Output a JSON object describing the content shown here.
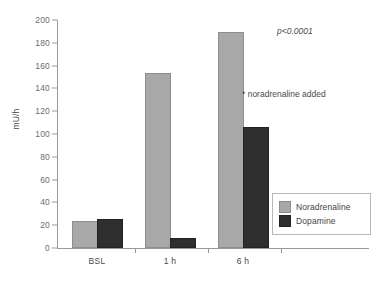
{
  "chart_data": {
    "type": "bar",
    "title": "",
    "xlabel": "",
    "ylabel": "mU/h",
    "categories": [
      "BSL",
      "1 h",
      "6 h"
    ],
    "ylim": [
      0,
      200
    ],
    "yticks": [
      0,
      20,
      40,
      60,
      80,
      100,
      120,
      140,
      160,
      180,
      200
    ],
    "grid": false,
    "legend_position": "bottom-right",
    "series": [
      {
        "name": "Noradrenaline",
        "color": "#a8a8a8",
        "values": [
          22,
          152,
          188
        ]
      },
      {
        "name": "Dopamine",
        "color": "#2e2e2e",
        "values": [
          24,
          7,
          104
        ]
      }
    ],
    "annotations": [
      {
        "id": "p-value",
        "text": "p<0.0001",
        "italic": true
      },
      {
        "id": "noradrenaline-added",
        "text": "* noradrenaline added",
        "italic": false
      }
    ]
  }
}
